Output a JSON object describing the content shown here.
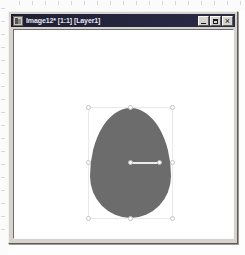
{
  "window": {
    "title": "Image12* [1:1] [Layer1]",
    "icon": "image-document-icon",
    "controls": {
      "minimize": "minimize-icon",
      "maximize": "maximize-icon",
      "close": "close-icon"
    }
  },
  "canvas": {
    "background_color": "#ffffff",
    "object": {
      "name": "egg-shape",
      "fill_color": "#6c6c6c",
      "selected": true
    },
    "selection": {
      "handle_color": "#fdfdfd",
      "outline_color": "#e9e9e9",
      "handles": [
        "top-left",
        "top-center",
        "top-right",
        "middle-left",
        "middle-right",
        "bottom-left",
        "bottom-center",
        "bottom-right"
      ],
      "pivot": {
        "name": "rotation-pivot",
        "arm_color": "#ececec"
      }
    }
  },
  "rulers": {
    "left_ticks": 18,
    "top_ticks": 20,
    "tick_color": "#d8d8d8"
  },
  "theme": {
    "titlebar_color": "#26263f",
    "window_face_color": "#d6d3ce",
    "accent_color": "#6c6c6c"
  }
}
